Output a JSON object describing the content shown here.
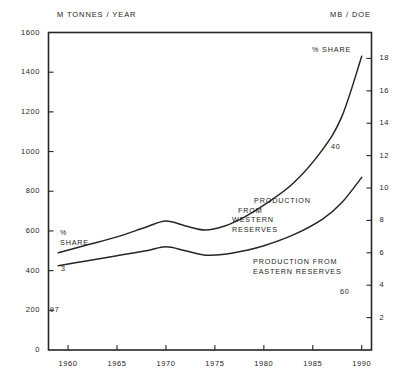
{
  "chart_data": {
    "type": "line",
    "title": "",
    "subtitle": "",
    "xlabel": "",
    "ylabel": "M TONNES / YEAR",
    "y2label": "MB / DOE",
    "xlim": [
      1958,
      1991
    ],
    "ylim": [
      0,
      1600
    ],
    "y2lim": [
      0,
      19.6
    ],
    "grid": false,
    "legend_position": "inline-annotations",
    "xticks": [
      "1960",
      "1965",
      "1970",
      "1975",
      "1980",
      "1985",
      "1990"
    ],
    "xtick_values": [
      1960,
      1965,
      1970,
      1975,
      1980,
      1985,
      1990
    ],
    "yticks": [
      "0",
      "200",
      "400",
      "600",
      "800",
      "1000",
      "1200",
      "1400",
      "1600"
    ],
    "ytick_values": [
      0,
      200,
      400,
      600,
      800,
      1000,
      1200,
      1400,
      1600
    ],
    "y2ticks": [
      "2",
      "4",
      "6",
      "8",
      "10",
      "12",
      "14",
      "16",
      "18"
    ],
    "y2tick_values": [
      2,
      4,
      6,
      8,
      10,
      12,
      14,
      16,
      18
    ],
    "x": [
      1959,
      1962,
      1965,
      1968,
      1970,
      1972,
      1974,
      1976,
      1978,
      1980,
      1983,
      1986,
      1988,
      1990
    ],
    "series": [
      {
        "name": "Total (upper curve)",
        "values": [
          490,
          530,
          570,
          620,
          650,
          625,
          605,
          625,
          670,
          730,
          840,
          1010,
          1180,
          1480
        ],
        "color": "#262626"
      },
      {
        "name": "Production from eastern reserves (lower curve)",
        "values": [
          425,
          450,
          475,
          500,
          520,
          500,
          478,
          482,
          500,
          525,
          580,
          660,
          745,
          870
        ],
        "color": "#262626"
      }
    ],
    "annotations": [
      {
        "name": "share-left",
        "text": "%\nSHARE",
        "x": 1960.5,
        "y": 660
      },
      {
        "name": "share-top",
        "text": "% SHARE",
        "x": 1987.5,
        "y": 1545
      },
      {
        "name": "western-reserves",
        "text": "PRODUCTION\nFROM\nWESTERN\nRESERVES",
        "x": 1978,
        "y": 795
      },
      {
        "name": "eastern-reserves",
        "text": "PRODUCTION   FROM\nEASTERN   RESERVES",
        "x": 1980,
        "y": 490
      },
      {
        "name": "share-value-3",
        "text": "3",
        "x": 1960.6,
        "y": 445
      },
      {
        "name": "share-value-97",
        "text": "97",
        "x": 1959.5,
        "y": 240
      },
      {
        "name": "share-value-40",
        "text": "40",
        "x": 1986,
        "y": 1055
      },
      {
        "name": "share-value-60",
        "text": "60",
        "x": 1987,
        "y": 320
      }
    ]
  },
  "axes": {
    "left_unit": "M TONNES / YEAR",
    "right_unit": "MB / DOE"
  },
  "annotations": {
    "share_left_line1": "%",
    "share_left_line2": "SHARE",
    "share_top": "% SHARE",
    "western_line1": "PRODUCTION",
    "western_line2": "FROM",
    "western_line3": "WESTERN",
    "western_line4": "RESERVES",
    "eastern_line1": "PRODUCTION   FROM",
    "eastern_line2": "EASTERN   RESERVES",
    "value_3": "3",
    "value_97": "97",
    "value_40": "40",
    "value_60": "60"
  },
  "colors": {
    "ink": "#262626",
    "background": "#ffffff"
  }
}
